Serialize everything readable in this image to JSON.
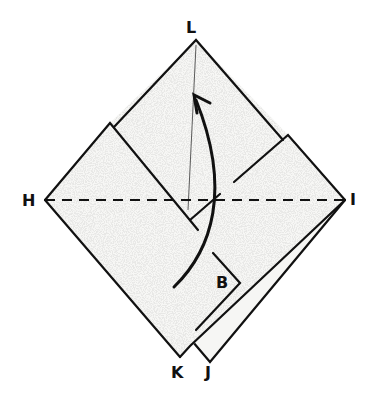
{
  "diagram": {
    "type": "origami-fold-step",
    "colors": {
      "paper": "#f7f7f5",
      "line": "#111111",
      "speckle": "#c8c8c8"
    },
    "labels": {
      "top": "L",
      "left": "H",
      "right": "I",
      "bottom_left": "K",
      "bottom_right": "J",
      "flap": "B"
    },
    "fold_line": {
      "style": "dashed",
      "from": "H",
      "to": "I",
      "meaning": "valley-fold"
    },
    "arrow": {
      "direction": "up",
      "meaning": "fold bottom up to top L"
    }
  }
}
